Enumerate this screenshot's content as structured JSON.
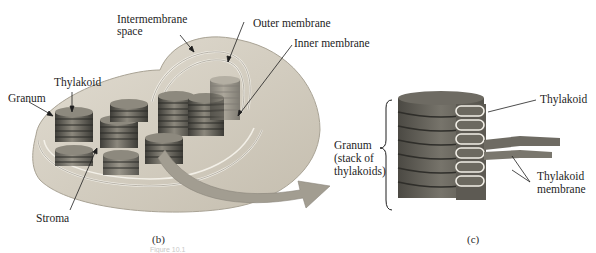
{
  "figure": {
    "panel_b": {
      "caption": "(b)",
      "labels": {
        "intermembrane_space_line1": "Intermembrane",
        "intermembrane_space_line2": "space",
        "outer_membrane": "Outer membrane",
        "inner_membrane": "Inner membrane",
        "thylakoid": "Thylakoid",
        "granum": "Granum",
        "stroma": "Stroma"
      }
    },
    "panel_c": {
      "caption": "(c)",
      "labels": {
        "granum_line1": "Granum",
        "granum_line2": "(stack of",
        "granum_line3": "thylakoids)",
        "thylakoid": "Thylakoid",
        "thylakoid_membrane_line1": "Thylakoid",
        "thylakoid_membrane_line2": "membrane"
      }
    },
    "footer_faint_text": "Figure 10.1",
    "colors": {
      "chloroplast_body": "#d6d0c4",
      "chloroplast_shadow": "#bdb6a8",
      "stack_dark": "#4a4a44",
      "stack_mid": "#7a776d",
      "arrow": "#9c978c",
      "granum_c": "#5f5c55",
      "membrane_line": "#f4f1ea"
    }
  }
}
